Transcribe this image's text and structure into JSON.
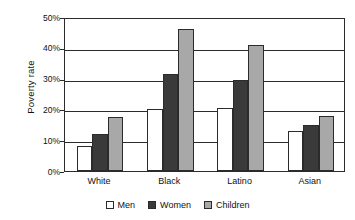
{
  "chart_data": {
    "type": "bar",
    "title": "",
    "subtitle": "",
    "xlabel": "",
    "ylabel": "Poverty rate",
    "categories": [
      "White",
      "Black",
      "Latino",
      "Asian"
    ],
    "series": [
      {
        "name": "Men",
        "color": "#ffffff",
        "values": [
          8,
          20,
          20.5,
          13
        ]
      },
      {
        "name": "Women",
        "color": "#3a3a3a",
        "values": [
          12,
          31.5,
          29.5,
          15
        ]
      },
      {
        "name": "Children",
        "color": "#a8a8a8",
        "values": [
          17.5,
          46,
          41,
          18
        ]
      }
    ],
    "ylim": [
      0,
      50
    ],
    "ytick_values": [
      0,
      10,
      20,
      30,
      40,
      50
    ],
    "ytick_labels": [
      "0%",
      "10%",
      "20%",
      "30%",
      "40%",
      "50%"
    ],
    "grid": "horizontal",
    "legend_position": "bottom",
    "axis_color": "#2b2b2b",
    "background": "#ffffff"
  }
}
